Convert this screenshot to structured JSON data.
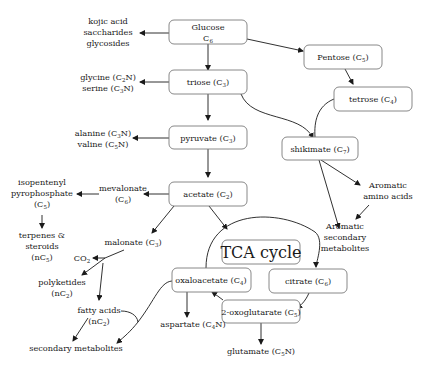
{
  "nodes": {
    "glucose": {
      "line1": "Glucose",
      "line2": "C",
      "sub": "6"
    },
    "pentose": {
      "label": "Pentose (C",
      "sub": "5",
      "close": ")"
    },
    "triose": {
      "label": "triose (C",
      "sub": "3",
      "close": ")"
    },
    "tetrose": {
      "label": "tetrose (C",
      "sub": "4",
      "close": ")"
    },
    "pyruvate": {
      "label": "pyruvate (C",
      "sub": "3",
      "close": ")"
    },
    "shikimate": {
      "label": "shikimate (C",
      "sub": "7",
      "close": ")"
    },
    "acetate": {
      "label": "acetate (C",
      "sub": "2",
      "close": ")"
    },
    "tca": {
      "label": "TCA cycle"
    },
    "oxaloacetate": {
      "label": "oxaloacetate (C",
      "sub": "4",
      "close": ")"
    },
    "citrate": {
      "label": "citrate (C",
      "sub": "6",
      "close": ")"
    },
    "oxoglutarate": {
      "label": "2-oxoglutarate (C",
      "sub": "5",
      "close": ")"
    }
  },
  "products": {
    "glucose_products": [
      "kojic acid",
      "saccharides",
      "glycosides"
    ],
    "glycine": {
      "label": "glycine (C",
      "sub": "2",
      "close": "N)"
    },
    "serine": {
      "label": "serine (C",
      "sub": "3",
      "close": "N)"
    },
    "alanine": {
      "label": "alanine (C",
      "sub": "3",
      "close": "N)"
    },
    "valine": {
      "label": "valine (C",
      "sub": "5",
      "close": "N)"
    },
    "mevalonate": {
      "line1": "mevalonate",
      "line2": "(C",
      "sub": "6",
      "close": ")"
    },
    "ipp": {
      "line1": "isopentenyl",
      "line2": "pyrophosphate",
      "line3": "(C",
      "sub": "5",
      "close": ")"
    },
    "terpenes": {
      "line1": "terpenes &",
      "line2": "steroids",
      "line3": "(nC",
      "sub": "5",
      "close": ")"
    },
    "malonate": {
      "label": "malonate (C",
      "sub": "3",
      "close": ")"
    },
    "co2": {
      "label": "CO",
      "sub": "2"
    },
    "polyketides": {
      "line1": "polyketides",
      "line2": "(nC",
      "sub": "2",
      "close": ")"
    },
    "fatty_acids": {
      "line1": "fatty acids",
      "line2": "(nC",
      "sub": "2",
      "close": ")"
    },
    "secondary": {
      "label": "secondary metabolites"
    },
    "aspartate": {
      "label": "aspartate (C",
      "sub": "4",
      "close": "N)"
    },
    "glutamate": {
      "label": "glutamate (C",
      "sub": "5",
      "close": "N)"
    },
    "aromatic_amino": {
      "line1": "Aromatic",
      "line2": "amino acids"
    },
    "aromatic_secondary": {
      "line1": "Aromatic",
      "line2": "secondary",
      "line3": "metabolites"
    }
  }
}
